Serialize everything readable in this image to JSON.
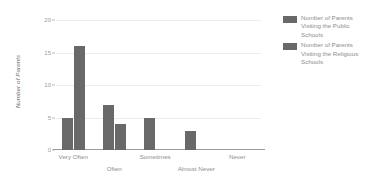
{
  "chart_data": {
    "type": "bar",
    "title": "",
    "xlabel": "",
    "ylabel": "Number of Parents",
    "ylim": [
      0,
      20
    ],
    "yticks": [
      0,
      5,
      10,
      15,
      20
    ],
    "ytick_labels": [
      "0",
      "5",
      "10",
      "15",
      "20"
    ],
    "grid": true,
    "legend_position": "right",
    "categories": [
      "Very Often",
      "Often",
      "Sometimes",
      "Almost Never",
      "Never"
    ],
    "series": [
      {
        "name": "Number of Parents Visiting the Public Schools",
        "color": "#696969",
        "values": [
          5,
          7,
          5,
          3,
          0
        ]
      },
      {
        "name": "Number of Parents Visiting the Religious Schools",
        "color": "#696969",
        "values": [
          16,
          4,
          0,
          0,
          0
        ]
      }
    ]
  },
  "axes": {
    "y_title": "Number of Parents",
    "y_ticks": [
      {
        "value": 20,
        "label": "20"
      },
      {
        "value": 15,
        "label": "15"
      },
      {
        "value": 10,
        "label": "10"
      },
      {
        "value": 5,
        "label": "5"
      },
      {
        "value": 0,
        "label": "0"
      }
    ],
    "x_categories": [
      {
        "label": "Very Often",
        "row": 0
      },
      {
        "label": "Often",
        "row": 1
      },
      {
        "label": "Sometimes",
        "row": 0
      },
      {
        "label": "Almost Never",
        "row": 1
      },
      {
        "label": "Never",
        "row": 0
      }
    ]
  },
  "legend": {
    "items": [
      {
        "label": "Number of Parents Visiting the Public Schools",
        "color": "#696969"
      },
      {
        "label": "Number of Parents Visiting the Religious Schools",
        "color": "#696969"
      }
    ]
  }
}
